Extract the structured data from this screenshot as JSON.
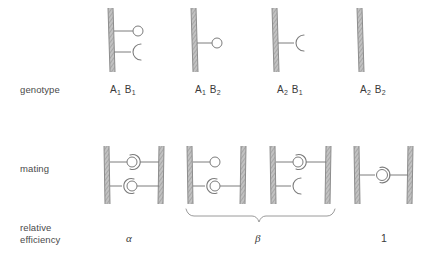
{
  "figure": {
    "rows": [
      {
        "id": "genotype",
        "label": "genotype"
      },
      {
        "id": "mating",
        "label": "mating"
      },
      {
        "id": "efficiency",
        "label": "relative\nefficiency"
      }
    ],
    "columns": [
      {
        "id": "col-1",
        "genotype_label": "A1 B1",
        "gene_a": "A",
        "gene_a_sub": "1",
        "gene_b": "B",
        "gene_b_sub": "1",
        "efficiency": "α",
        "single_cell": {
          "appendages": [
            {
              "type": "receptor-circle",
              "position": "upper"
            },
            {
              "type": "cup-crescent",
              "position": "lower",
              "opening": "right"
            }
          ]
        },
        "mating_pair": {
          "upper": {
            "left": "receptor-circle",
            "right": "cup-crescent"
          },
          "lower": {
            "left": "cup-crescent",
            "right": "receptor-circle"
          }
        }
      },
      {
        "id": "col-2",
        "genotype_label": "A1 B2",
        "gene_a": "A",
        "gene_a_sub": "1",
        "gene_b": "B",
        "gene_b_sub": "2",
        "efficiency": "β",
        "single_cell": {
          "appendages": [
            {
              "type": "receptor-circle",
              "position": "middle"
            }
          ]
        },
        "mating_pair": {
          "upper": {
            "left": "receptor-circle",
            "right": "none"
          },
          "lower": {
            "left": "cup-crescent",
            "right": "receptor-circle"
          }
        }
      },
      {
        "id": "col-3",
        "genotype_label": "A2 B1",
        "gene_a": "A",
        "gene_a_sub": "2",
        "gene_b": "B",
        "gene_b_sub": "1",
        "efficiency": "β",
        "single_cell": {
          "appendages": [
            {
              "type": "cup-crescent",
              "position": "middle",
              "opening": "right"
            }
          ]
        },
        "mating_pair": {
          "upper": {
            "left": "receptor-circle",
            "right": "cup-crescent"
          },
          "lower": {
            "left": "cup-crescent",
            "right": "none"
          }
        }
      },
      {
        "id": "col-4",
        "genotype_label": "A2 B2",
        "gene_a": "A",
        "gene_a_sub": "2",
        "gene_b": "B",
        "gene_b_sub": "2",
        "efficiency": "1",
        "single_cell": {
          "appendages": []
        },
        "mating_pair": {
          "middle": {
            "left": "receptor-circle",
            "right": "cup-crescent"
          }
        }
      }
    ],
    "brace": {
      "label": "β",
      "spans_columns": [
        "col-2",
        "col-3"
      ]
    },
    "colors": {
      "ink": "#3b3b3b",
      "line": "#7c7c7c",
      "wall_fill": "#b5b5b5",
      "wall_edge": "#8d8d8d",
      "background": "#ffffff"
    }
  }
}
